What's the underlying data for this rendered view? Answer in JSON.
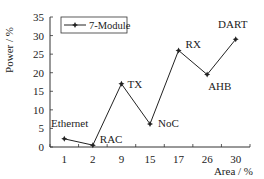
{
  "chart_data": {
    "type": "line",
    "title": "",
    "xlabel": "Area / %",
    "ylabel": "Power / %",
    "categories": [
      "1",
      "2",
      "9",
      "15",
      "17",
      "26",
      "30"
    ],
    "series": [
      {
        "name": "7-Module",
        "values": [
          2.2,
          0.5,
          17,
          6.2,
          26,
          19.5,
          29
        ],
        "point_labels": [
          "Ethernet",
          "RAC",
          "TX",
          "NoC",
          "RX",
          "AHB",
          "DART"
        ]
      }
    ],
    "ylim": [
      0,
      35
    ],
    "yticks": [
      0,
      5,
      10,
      15,
      20,
      25,
      30,
      35
    ],
    "grid": false,
    "legend_position": "upper-left"
  },
  "colors": {
    "line": "#222222",
    "axis": "#333333",
    "background": "#ffffff"
  }
}
